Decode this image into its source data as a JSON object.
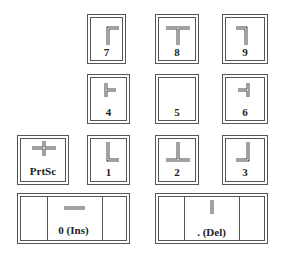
{
  "keys": [
    {
      "id": "7",
      "label": "7",
      "glyph": "corner-top-left"
    },
    {
      "id": "8",
      "label": "8",
      "glyph": "tee-down"
    },
    {
      "id": "9",
      "label": "9",
      "glyph": "corner-top-right"
    },
    {
      "id": "4",
      "label": "4",
      "glyph": "tee-right"
    },
    {
      "id": "5",
      "label": "5",
      "glyph": "none"
    },
    {
      "id": "6",
      "label": "6",
      "glyph": "tee-left"
    },
    {
      "id": "prtsc",
      "label": "PrtSc",
      "glyph": "cross"
    },
    {
      "id": "1",
      "label": "1",
      "glyph": "corner-bottom-left"
    },
    {
      "id": "2",
      "label": "2",
      "glyph": "tee-up"
    },
    {
      "id": "3",
      "label": "3",
      "glyph": "corner-bottom-right"
    },
    {
      "id": "0",
      "label": "0 (Ins)",
      "glyph": "horizontal-line"
    },
    {
      "id": "del",
      "label": ". (Del)",
      "glyph": "vertical-line"
    }
  ]
}
